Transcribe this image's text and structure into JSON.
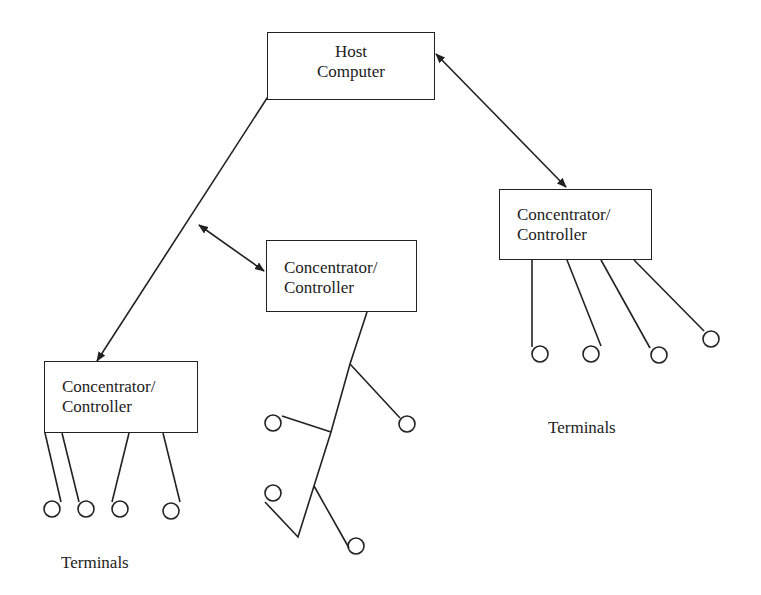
{
  "host": {
    "line1": "Host",
    "line2": "Computer"
  },
  "concentrators": {
    "right": {
      "line1": "Concentrator/",
      "line2": "Controller"
    },
    "middle": {
      "line1": "Concentrator/",
      "line2": "Controller"
    },
    "left": {
      "line1": "Concentrator/",
      "line2": "Controller"
    }
  },
  "labels": {
    "terminals_right": "Terminals",
    "terminals_left": "Terminals"
  },
  "colors": {
    "stroke": "#222222",
    "background": "#ffffff"
  }
}
